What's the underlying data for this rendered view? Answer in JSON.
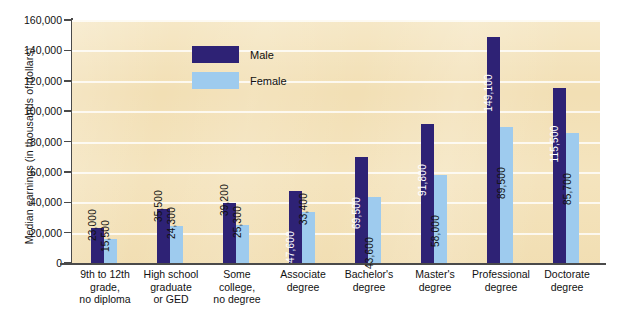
{
  "chart_data": {
    "type": "bar",
    "title": "",
    "xlabel": "",
    "ylabel": "Median earnings (in thousands of dollars)",
    "ylim": [
      0,
      160000
    ],
    "ytick_labels": [
      "160,000",
      "140,000",
      "120,000",
      "100,000",
      "80,000",
      "60,000",
      "40,000",
      "20,000",
      "0"
    ],
    "ytick_values": [
      160000,
      140000,
      120000,
      100000,
      80000,
      60000,
      40000,
      20000,
      0
    ],
    "grid": true,
    "legend_position": "upper-left-inside",
    "categories": [
      "9th to 12th grade, no diploma",
      "High school graduate or GED",
      "Some college, no degree",
      "Associate degree",
      "Bachelor's degree",
      "Master's degree",
      "Professional degree",
      "Doctorate degree"
    ],
    "category_lines": [
      [
        "9th to 12th",
        "grade,",
        "no diploma"
      ],
      [
        "High school",
        "graduate",
        "or GED"
      ],
      [
        "Some",
        "college,",
        "no degree"
      ],
      [
        "Associate",
        "degree"
      ],
      [
        "Bachelor's",
        "degree"
      ],
      [
        "Master's",
        "degree"
      ],
      [
        "Professional",
        "degree"
      ],
      [
        "Doctorate",
        "degree"
      ]
    ],
    "series": [
      {
        "name": "Male",
        "color": "#2e2275",
        "values": [
          23000,
          35500,
          39200,
          47600,
          69500,
          91800,
          149100,
          115500
        ],
        "labels": [
          "23,000",
          "35,500",
          "39,200",
          "47,600",
          "69,500",
          "91,800",
          "149,100",
          "115,500"
        ]
      },
      {
        "name": "Female",
        "color": "#9ecbee",
        "values": [
          15500,
          24300,
          25300,
          33400,
          43600,
          58000,
          89500,
          85700
        ],
        "labels": [
          "15,500",
          "24,300",
          "25,300",
          "33,400",
          "43,600",
          "58,000",
          "89,500",
          "85,700"
        ]
      }
    ]
  },
  "legend": {
    "items": [
      {
        "label": "Male",
        "color": "#2e2275"
      },
      {
        "label": "Female",
        "color": "#9ecbee"
      }
    ]
  },
  "colors": {
    "plot_background": "#f2dfb4",
    "male": "#2e2275",
    "female": "#9ecbee",
    "axis": "#4a4a4a",
    "gridline": "#ffffff",
    "page_background": "#ffffff"
  }
}
